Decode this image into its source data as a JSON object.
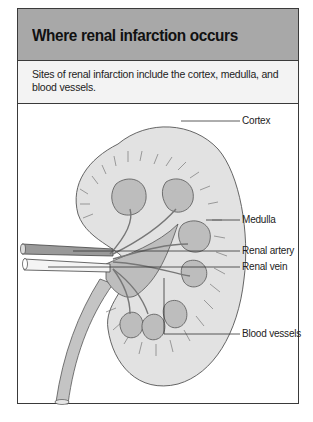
{
  "figure": {
    "title": "Where renal infarction occurs",
    "caption": "Sites of renal infarction include the cortex, medulla, and blood vessels.",
    "labels": {
      "cortex": "Cortex",
      "medulla": "Medulla",
      "renal_artery": "Renal artery",
      "renal_vein": "Renal vein",
      "blood_vessels": "Blood vessels"
    }
  }
}
